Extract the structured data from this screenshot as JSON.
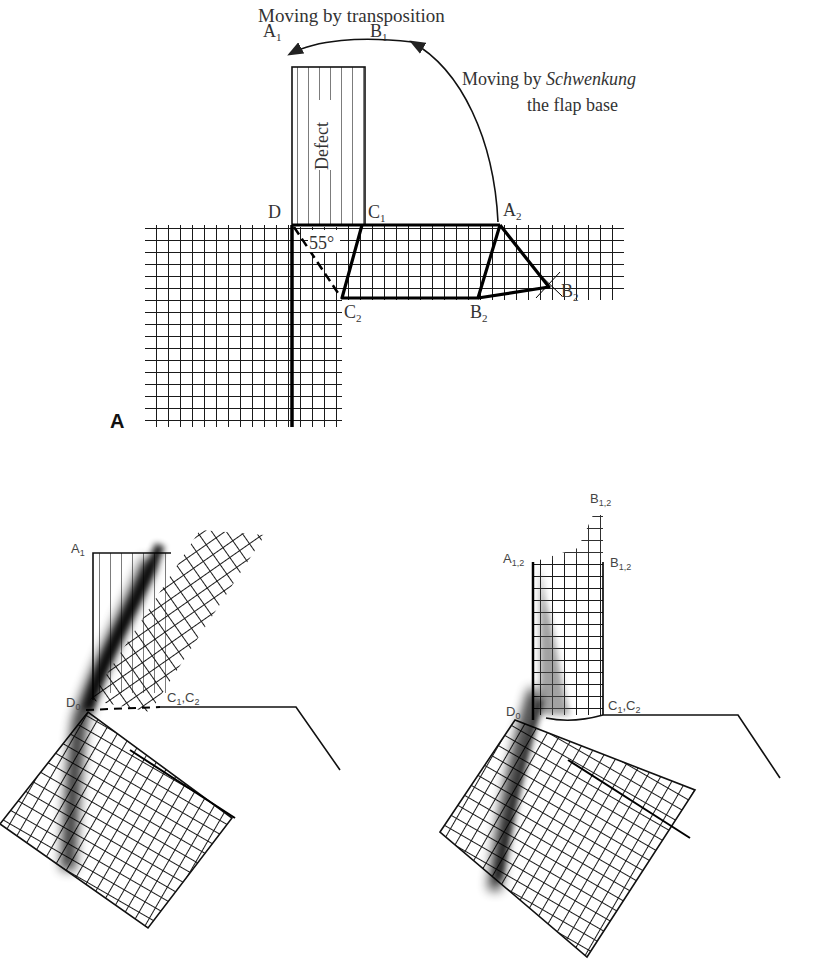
{
  "figure": {
    "panel_a": {
      "panel_letter": "A",
      "annotations": {
        "transposition": "Moving by transposition",
        "schwenkung_prefix": "Moving by ",
        "schwenkung_italic": "Schwenkung",
        "schwenkung_line2": "the flap base"
      },
      "defect_label": "Defect",
      "angle_label": "55°",
      "points": {
        "A1": "A",
        "A1_sub": "1",
        "B1": "B",
        "B1_sub": "1",
        "D": "D",
        "C1": "C",
        "C1_sub": "1",
        "A2": "A",
        "A2_sub": "2",
        "B2_right": "B",
        "B2_right_sub": "2",
        "C2": "C",
        "C2_sub": "2",
        "B2_bottom": "B",
        "B2_bottom_sub": "2"
      }
    },
    "panel_b_left": {
      "labels": {
        "A1": "A",
        "A1_sub": "1",
        "D0": "D",
        "D0_sub": "0",
        "C1C2": "C",
        "C1C2_sub1": "1",
        "C1C2_mid": ",C",
        "C1C2_sub2": "2"
      }
    },
    "panel_b_right": {
      "labels": {
        "B12_top": "B",
        "B12_top_sub": "1,2",
        "A12": "A",
        "A12_sub": "1,2",
        "B12": "B",
        "B12_sub": "1,2",
        "D0": "D",
        "D0_sub": "0",
        "C1C2": "C",
        "C1C2_sub1": "1",
        "C1C2_mid": ",C",
        "C1C2_sub2": "2"
      }
    },
    "colors": {
      "ink": "#111111",
      "background": "#ffffff",
      "label_gray": "#333333"
    }
  }
}
